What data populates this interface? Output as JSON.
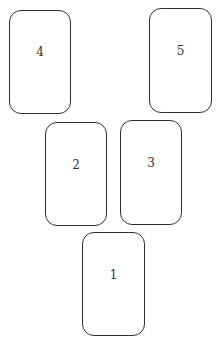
{
  "diagram": {
    "type": "card-spread-layout",
    "style": {
      "card_border_color": "#2e2e2e",
      "label_color": "#333333",
      "background": "#ffffff"
    },
    "cards": [
      {
        "position": "1",
        "left": 82,
        "top": 232,
        "width": 63,
        "height": 104,
        "label_top": 36
      },
      {
        "position": "2",
        "left": 45,
        "top": 122,
        "width": 62,
        "height": 104,
        "label_top": 36
      },
      {
        "position": "3",
        "left": 120,
        "top": 120,
        "width": 62,
        "height": 105,
        "label_top": 36
      },
      {
        "position": "4",
        "left": 9,
        "top": 10,
        "width": 62,
        "height": 104,
        "label_top": 35
      },
      {
        "position": "5",
        "left": 149,
        "top": 8,
        "width": 63,
        "height": 105,
        "label_top": 36
      }
    ]
  }
}
